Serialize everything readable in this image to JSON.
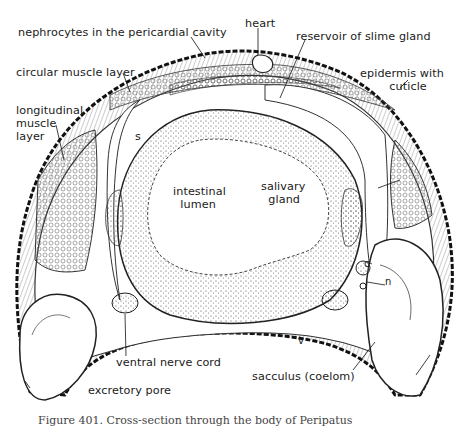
{
  "diagram": {
    "labels": {
      "nephrocytes": "nephrocytes in the pericardial cavity",
      "heart": "heart",
      "reservoir": "reservoir of slime gland",
      "circular_muscle": "circular muscle layer",
      "epidermis": "epidermis with\n        cuticle",
      "longitudinal_muscle": "longitudinal\nmuscle\nlayer",
      "s": "s",
      "intestinal_lumen": "intestinal\n  lumen",
      "salivary_gland": "salivary\n  gland",
      "c": "c",
      "n": "n",
      "v": "v",
      "ventral_nerve_cord": "ventral nerve cord",
      "sacculus": "sacculus (coelom)",
      "excretory_pore": "excretory pore"
    },
    "caption": "Figure 401.   Cross-section through the body of Peripatus"
  }
}
